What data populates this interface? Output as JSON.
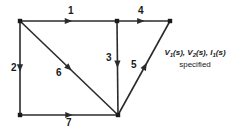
{
  "figure": {
    "type": "signal-flow-graph",
    "background_color": "#ffffff",
    "line_color": "#2b2b2b",
    "node_color": "#1a1a1a",
    "label_color": "#1a1a1a"
  },
  "nodes": [
    {
      "id": "top-left",
      "x": 20,
      "y": 21
    },
    {
      "id": "top-middle",
      "x": 117,
      "y": 21
    },
    {
      "id": "top-right",
      "x": 170,
      "y": 21
    },
    {
      "id": "bottom-left",
      "x": 20,
      "y": 115
    },
    {
      "id": "bottom-middle",
      "x": 118,
      "y": 115
    }
  ],
  "edges": [
    {
      "label": "1",
      "from": "top-left",
      "to": "top-middle",
      "label_x": 68,
      "label_y": 6,
      "arrow_t": 0.5
    },
    {
      "label": "2",
      "from": "top-left",
      "to": "bottom-left",
      "label_x": 11,
      "label_y": 63,
      "arrow_t": 0.5
    },
    {
      "label": "3",
      "from": "top-middle",
      "to": "bottom-middle",
      "label_x": 106,
      "label_y": 53,
      "arrow_t": 0.46
    },
    {
      "label": "4",
      "from": "top-middle",
      "to": "top-right",
      "label_x": 138,
      "label_y": 6,
      "arrow_t": 0.45
    },
    {
      "label": "5",
      "from": "bottom-middle",
      "to": "top-right",
      "label_x": 131,
      "label_y": 60,
      "arrow_t": 0.52
    },
    {
      "label": "6",
      "from": "top-left",
      "to": "bottom-middle",
      "label_x": 56,
      "label_y": 68,
      "arrow_t": 0.5
    },
    {
      "label": "7",
      "from": "bottom-left",
      "to": "bottom-middle",
      "label_x": 66,
      "label_y": 118,
      "arrow_t": 0.5
    }
  ],
  "annotation": {
    "line1_parts": [
      {
        "text": "V",
        "sub": "1"
      },
      {
        "text": "(s),",
        "sub": ""
      },
      {
        "text": "V",
        "sub": "2"
      },
      {
        "text": "(s),",
        "sub": ""
      },
      {
        "text": "I",
        "sub": "1"
      },
      {
        "text": "(s)",
        "sub": ""
      }
    ],
    "line1_plain": "V1(s),  V2(s),  I1(s)",
    "line2": "specified"
  }
}
